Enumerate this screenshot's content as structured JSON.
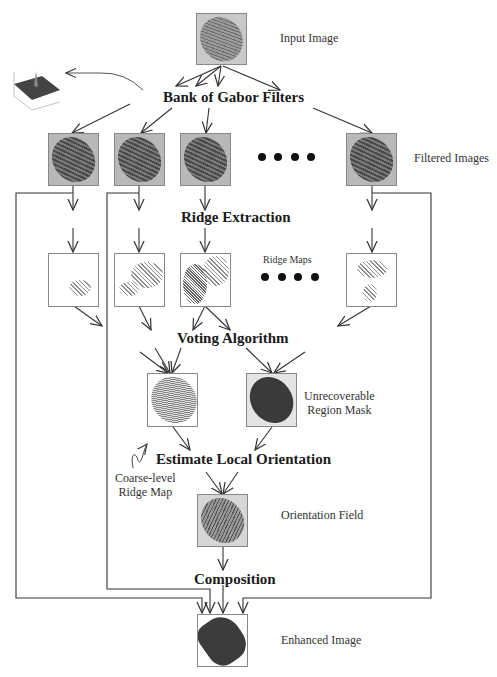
{
  "diagram": {
    "labels": {
      "input_image": "Input Image",
      "filtered_images": "Filtered Images",
      "ridge_maps": "Ridge Maps",
      "unrecoverable_mask_line1": "Unrecoverable",
      "unrecoverable_mask_line2": "Region Mask",
      "coarse_ridge_line1": "Coarse-level",
      "coarse_ridge_line2": "Ridge Map",
      "orientation_field": "Orientation Field",
      "enhanced_image": "Enhanced Image"
    },
    "steps": {
      "gabor": "Bank of Gabor Filters",
      "ridge_extraction": "Ridge Extraction",
      "voting": "Voting Algorithm",
      "orientation": "Estimate Local Orientation",
      "composition": "Composition"
    },
    "nodes": [
      {
        "id": "input",
        "kind": "image"
      },
      {
        "id": "filtered_1",
        "kind": "image"
      },
      {
        "id": "filtered_2",
        "kind": "image"
      },
      {
        "id": "filtered_3",
        "kind": "image"
      },
      {
        "id": "filtered_n",
        "kind": "image"
      },
      {
        "id": "ridge_1",
        "kind": "image"
      },
      {
        "id": "ridge_2",
        "kind": "image"
      },
      {
        "id": "ridge_3",
        "kind": "image"
      },
      {
        "id": "ridge_n",
        "kind": "image"
      },
      {
        "id": "coarse_ridge_map",
        "kind": "image"
      },
      {
        "id": "unrecoverable_mask",
        "kind": "image"
      },
      {
        "id": "orientation_field",
        "kind": "image"
      },
      {
        "id": "enhanced",
        "kind": "image"
      }
    ],
    "ellipsis_dots": 4,
    "colors": {
      "line": "#333333",
      "background": "#ffffff"
    }
  }
}
